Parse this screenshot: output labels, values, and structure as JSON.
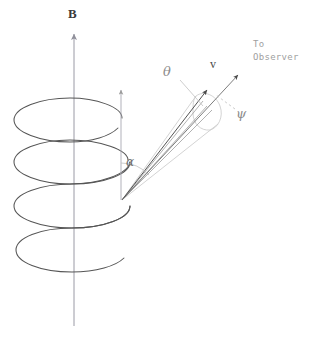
{
  "figure": {
    "kind": "physics-diagram",
    "background_color": "#ffffff",
    "width": 317,
    "height": 339
  },
  "labels": {
    "magnetic_field": "B",
    "pitch_angle": "α",
    "cone_half_angle": "θ",
    "velocity": "v",
    "sight_angle": "ψ",
    "observer_line1": "To",
    "observer_line2": "Observer"
  },
  "colors": {
    "helix_stroke": "#555555",
    "axis_stroke": "#9a9aa5",
    "cone_stroke": "#c2c2c2",
    "ray_stroke": "#8a8a8a",
    "velocity_stroke": "#4a4a4a",
    "dash_stroke": "#b5b5b5",
    "label_dark": "#3a3a3a",
    "label_gray": "#8c8c8c",
    "label_light": "#a0a0a0"
  },
  "geometry": {
    "b_axis": {
      "x": 74,
      "y_top": 32,
      "y_bottom": 326,
      "label_x": 70,
      "label_y": 10
    },
    "pitch_axis": {
      "x": 121,
      "y_top": 88,
      "y_bottom": 200
    },
    "helix": {
      "center_x": 72,
      "rx": 58,
      "ry": 20,
      "turn_tops": [
        113,
        155,
        200,
        243
      ],
      "turns": 4
    },
    "cone_apex": {
      "x": 122,
      "y": 200
    },
    "cone_tip": {
      "x": 228,
      "y": 98
    },
    "velocity_arrow": {
      "x1": 122,
      "y1": 200,
      "x2": 209,
      "y2": 89
    },
    "observer_arrow": {
      "x1": 122,
      "y1": 200,
      "x2": 240,
      "y2": 73
    },
    "cross_section_ellipse": {
      "cx": 205,
      "cy": 112,
      "rx": 13,
      "ry": 18,
      "rotation": -40
    },
    "label_positions": {
      "alpha": {
        "x": 127,
        "y": 160
      },
      "theta": {
        "x": 165,
        "y": 70
      },
      "v": {
        "x": 212,
        "y": 62
      },
      "psi": {
        "x": 238,
        "y": 112
      },
      "observer": {
        "x": 254,
        "y": 43
      }
    }
  },
  "annotations": {
    "cone_leaders": [
      {
        "from_x": 178,
        "from_y": 80,
        "to_x": 200,
        "to_y": 104
      },
      {
        "from_x": 236,
        "from_y": 110,
        "to_x": 216,
        "to_y": 96
      }
    ]
  }
}
